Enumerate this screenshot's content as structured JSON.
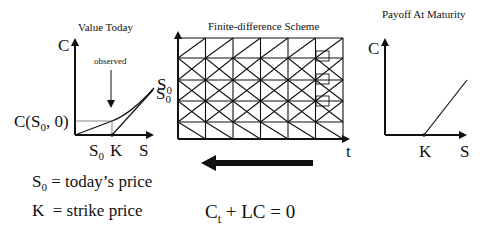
{
  "panels": {
    "left": {
      "title": "Value Today",
      "y_axis_label": "C",
      "x_axis_label": "S",
      "annotation": "observed",
      "curve_label": "S",
      "curve_label_sub": "0",
      "value_label_prefix": "C(S",
      "value_label_sub": "0",
      "value_label_suffix": ", 0)",
      "tick_s0": "S",
      "tick_s0_sub": "0",
      "tick_k": "K"
    },
    "center": {
      "title": "Finite-difference Scheme",
      "y_axis_label": "S",
      "y_axis_label_sub": "0",
      "x_axis_label": "t",
      "grid": {
        "columns": 6,
        "rows": 5,
        "row_patterns": [
          "slash",
          "cross",
          "cross",
          "cross",
          "backslash"
        ]
      },
      "direction": "backward-in-time"
    },
    "right": {
      "title": "Payoff At Maturity",
      "y_axis_label": "C",
      "x_axis_label": "S",
      "tick_k": "K"
    }
  },
  "legend": {
    "s0_symbol": "S",
    "s0_sub": "0",
    "s0_text": " = today’s price",
    "k_symbol": "K",
    "k_text": "  = strike price"
  },
  "equation": {
    "c": "C",
    "c_sub": "t",
    "rest": " + LC = 0"
  },
  "colors": {
    "ink": "#111111",
    "background": "#ffffff"
  }
}
